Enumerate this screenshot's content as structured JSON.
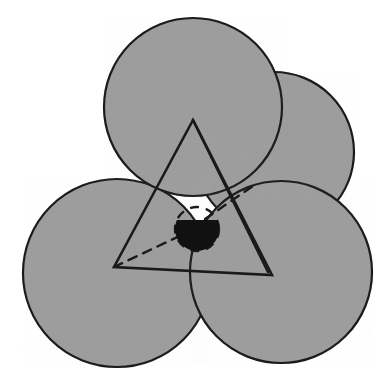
{
  "figure": {
    "title": "Sphere packing with interstitial void sphere",
    "canvas": {
      "width": 392,
      "height": 388,
      "background": "#ffffff"
    },
    "style": {
      "sphere_fill": "#9d9d9d",
      "sphere_stroke": "#1a1a1a",
      "sphere_stroke_width": 2.2,
      "line_stroke": "#1a1a1a",
      "triangle_stroke_width": 2.6,
      "hidden_line_stroke_width": 2.4,
      "hidden_line_dash": "9 7",
      "interstitial_fill": "#111111",
      "noise_opacity": 0.1
    },
    "spheres": [
      {
        "name": "top-sphere",
        "cx": 193,
        "cy": 107,
        "r": 89,
        "label": "top sphere",
        "occluded": false
      },
      {
        "name": "back-right-sphere",
        "cx": 274,
        "cy": 152,
        "r": 80,
        "label": "back right sphere (hidden)",
        "occluded": true
      },
      {
        "name": "lower-left-sphere",
        "cx": 117,
        "cy": 273,
        "r": 94,
        "label": "lower left sphere",
        "occluded": false
      },
      {
        "name": "lower-right-sphere",
        "cx": 281,
        "cy": 272,
        "r": 91,
        "label": "lower right sphere",
        "occluded": false
      }
    ],
    "triangle": {
      "name": "center-triangle",
      "label": "triangle joining sphere centers",
      "vertices": [
        {
          "name": "apex-vertex",
          "x": 193,
          "y": 120
        },
        {
          "name": "bottom-left-vertex",
          "x": 114,
          "y": 267
        },
        {
          "name": "bottom-right-vertex",
          "x": 272,
          "y": 275
        }
      ]
    },
    "back_edge": {
      "name": "tetrahedron-back-edge",
      "label": "back edge of tetrahedron",
      "from": {
        "x": 193,
        "y": 120
      },
      "to": {
        "x": 268,
        "y": 272
      }
    },
    "hidden_edges": [
      {
        "name": "hidden-edge-left",
        "label": "hidden edge to interstitial sphere, lower left",
        "from": {
          "x": 114,
          "y": 267
        },
        "to": {
          "x": 186,
          "y": 233
        }
      },
      {
        "name": "hidden-edge-upper-right",
        "label": "hidden edge to interstitial sphere, upper right",
        "from": {
          "x": 205,
          "y": 219
        },
        "to": {
          "x": 253,
          "y": 186
        }
      }
    ],
    "interstitial": {
      "name": "interstitial-sphere",
      "label": "interstitial void sphere",
      "cx": 197,
      "cy": 229,
      "r": 22,
      "solid_fraction": 0.62,
      "solid_cap_top_y": 220
    }
  }
}
